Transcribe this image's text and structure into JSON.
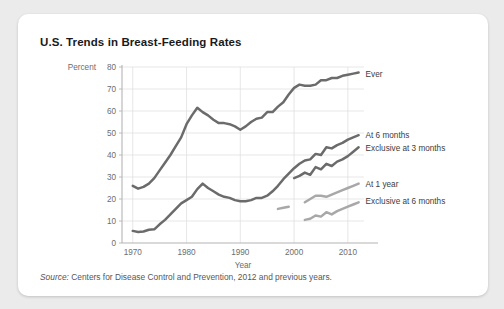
{
  "card": {
    "title": "U.S. Trends in Breast-Feeding Rates",
    "source_prefix": "Source:",
    "source_text": "Centers for Disease Control and Prevention, 2012 and previous years."
  },
  "colors": {
    "background": "#ebebeb",
    "card": "#ffffff",
    "series_dark": "#6b6b6b",
    "series_light": "#a8a8a8",
    "grid": "#dcdcdc",
    "axis": "#b4b4b4",
    "title_text": "#1a1a1a",
    "tick_text": "#6d6d6d"
  },
  "chart_data": {
    "type": "line",
    "title": "U.S. Trends in Breast-Feeding Rates",
    "xlabel": "Year",
    "ylabel": "Percent",
    "xlim": [
      1968,
      2013
    ],
    "ylim": [
      0,
      80
    ],
    "xticks": [
      1970,
      1980,
      1990,
      2000,
      2010
    ],
    "yticks": [
      0,
      10,
      20,
      30,
      40,
      50,
      60,
      70,
      80
    ],
    "grid": true,
    "legend_position": "right-of-lines",
    "series": [
      {
        "name": "Ever",
        "color": "#6b6b6b",
        "label": "Ever",
        "label_x": 2012,
        "label_y": 77,
        "x": [
          1970,
          1971,
          1972,
          1973,
          1974,
          1975,
          1976,
          1977,
          1978,
          1979,
          1980,
          1981,
          1982,
          1983,
          1984,
          1985,
          1986,
          1987,
          1988,
          1989,
          1990,
          1991,
          1992,
          1993,
          1994,
          1995,
          1996,
          1997,
          1998,
          1999,
          2000,
          2001,
          2002,
          2003,
          2004,
          2005,
          2006,
          2007,
          2008,
          2009,
          2010,
          2011,
          2012
        ],
        "y": [
          26.0,
          24.7,
          25.5,
          27.0,
          29.5,
          33.0,
          36.5,
          40.0,
          44.0,
          48.0,
          54.0,
          58.0,
          61.5,
          59.5,
          58.0,
          56.0,
          54.5,
          54.5,
          54.0,
          53.0,
          51.5,
          53.0,
          55.0,
          56.5,
          57.0,
          59.5,
          59.5,
          62.0,
          64.0,
          67.5,
          70.5,
          72.0,
          71.5,
          71.5,
          72.0,
          74.0,
          74.0,
          75.0,
          75.0,
          76.0,
          76.5,
          77.0,
          77.5
        ]
      },
      {
        "name": "At 6 months",
        "color": "#6b6b6b",
        "label": "At 6 months",
        "label_x": 2012,
        "label_y": 49,
        "x": [
          1970,
          1971,
          1972,
          1973,
          1974,
          1975,
          1976,
          1977,
          1978,
          1979,
          1980,
          1981,
          1982,
          1983,
          1984,
          1985,
          1986,
          1987,
          1988,
          1989,
          1990,
          1991,
          1992,
          1993,
          1994,
          1995,
          1996,
          1997,
          1998,
          1999,
          2000,
          2001,
          2002,
          2003,
          2004,
          2005,
          2006,
          2007,
          2008,
          2009,
          2010,
          2011,
          2012
        ],
        "y": [
          5.5,
          5.0,
          5.2,
          6.0,
          6.2,
          8.5,
          10.5,
          13.0,
          15.5,
          18.0,
          19.5,
          21.0,
          24.5,
          27.0,
          25.0,
          23.5,
          22.0,
          21.0,
          20.5,
          19.5,
          19.0,
          19.0,
          19.5,
          20.5,
          20.5,
          21.5,
          23.5,
          26.0,
          29.0,
          31.5,
          34.0,
          36.0,
          37.5,
          38.0,
          40.5,
          40.0,
          43.5,
          43.0,
          44.5,
          45.5,
          47.0,
          48.0,
          49.0
        ]
      },
      {
        "name": "Exclusive at 3 months",
        "color": "#6b6b6b",
        "label": "Exclusive at 3 months",
        "label_x": 2012,
        "label_y": 43,
        "x": [
          2000,
          2001,
          2002,
          2003,
          2004,
          2005,
          2006,
          2007,
          2008,
          2009,
          2010,
          2011,
          2012
        ],
        "y": [
          29.5,
          30.5,
          32.0,
          31.0,
          34.5,
          33.5,
          36.0,
          35.0,
          37.0,
          38.0,
          39.5,
          41.5,
          43.5
        ]
      },
      {
        "name": "At 1 year",
        "color": "#a8a8a8",
        "label": "At 1 year",
        "label_x": 2012,
        "label_y": 27,
        "segments": [
          {
            "x": [
              1997,
              1998,
              1999
            ],
            "y": [
              15.5,
              16.0,
              16.5
            ]
          },
          {
            "x": [
              2002,
              2003,
              2004,
              2005,
              2006,
              2007,
              2008,
              2009,
              2010,
              2011,
              2012
            ],
            "y": [
              18.5,
              20.0,
              21.5,
              21.5,
              21.0,
              22.0,
              23.0,
              24.0,
              25.0,
              26.0,
              27.0
            ]
          }
        ]
      },
      {
        "name": "Exclusive at 6 months",
        "color": "#a8a8a8",
        "label": "Exclusive at 6 months",
        "label_x": 2012,
        "label_y": 19,
        "x": [
          2002,
          2003,
          2004,
          2005,
          2006,
          2007,
          2008,
          2009,
          2010,
          2011,
          2012
        ],
        "y": [
          10.5,
          11.0,
          12.5,
          12.0,
          14.0,
          13.0,
          14.5,
          15.5,
          16.5,
          17.5,
          18.5
        ]
      }
    ]
  }
}
